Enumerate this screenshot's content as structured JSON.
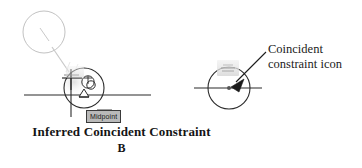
{
  "figure": {
    "label": "Inferred coincident constraint illustration",
    "background_color": "#ffffff"
  },
  "panel_left": {
    "name": "inferred-coincident-constraint-panel",
    "tooltip": {
      "text": "Midpoint",
      "background_color": "#b9b9b9",
      "border_color": "#3a3a3a"
    },
    "geometry": {
      "circle_center_x": 84,
      "circle_center_y": 88,
      "circle_radius": 20,
      "horizontal_line_x1": 24,
      "horizontal_line_x2": 151,
      "horizontal_line_y": 95,
      "vertical_line_x": 71,
      "vertical_line_y1": 72,
      "vertical_line_y2": 117,
      "detail_circle_center_x": 44,
      "detail_circle_center_y": 32,
      "detail_circle_radius": 21
    },
    "icons": {
      "cursor": "crosshair-cursor-icon",
      "constraint": "coincident-constraint-glyph-icon",
      "midpoint_marker": "midpoint-triangle-icon",
      "detail_bubble": "magnifier-detail-circle-icon"
    },
    "stroke_color": "#2b2b2b",
    "leader_color": "#c9c9c9"
  },
  "panel_right": {
    "name": "coincident-constraint-icon-panel",
    "callout": {
      "line1": "Coincident",
      "line2": "constraint icon"
    },
    "geometry": {
      "circle_center_x": 229,
      "circle_center_y": 88,
      "circle_radius": 21,
      "horizontal_line_x1": 194,
      "horizontal_line_x2": 262,
      "horizontal_line_y": 88,
      "arrow_tail_x": 265,
      "arrow_tail_y": 54,
      "arrow_head_x": 231,
      "arrow_head_y": 87
    },
    "icons": {
      "constraint_badge": "coincident-constraint-badge-icon",
      "center_point": "center-point-icon",
      "leader_arrow": "leader-arrow-icon"
    },
    "stroke_color": "#2b2b2b"
  },
  "captions": {
    "main": "Inferred Coincident Constraint",
    "sub": "B"
  },
  "colors": {
    "line": "#2b2b2b",
    "faint_line": "#c9c9c9",
    "text": "#141414",
    "tooltip_bg": "#b9b9b9",
    "glyph_gray": "#dcdcdc"
  }
}
